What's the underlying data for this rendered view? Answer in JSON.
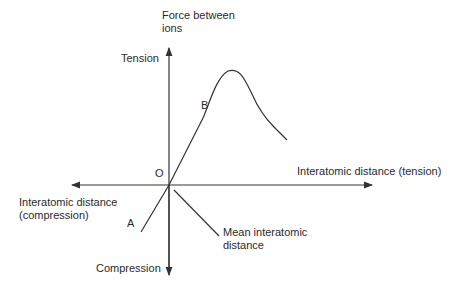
{
  "diagram": {
    "y_axis_label_line1": "Force between",
    "y_axis_label_line2": "ions",
    "y_positive_label": "Tension",
    "y_negative_label": "Compression",
    "x_negative_label_line1": "Interatomic distance",
    "x_negative_label_line2": "(compression)",
    "x_positive_label": "Interatomic distance (tension)",
    "origin_label": "O",
    "point_a_label": "A",
    "point_b_label": "B",
    "mean_label_line1": "Mean interatomic",
    "mean_label_line2": "distance",
    "line_color": "#333333"
  }
}
